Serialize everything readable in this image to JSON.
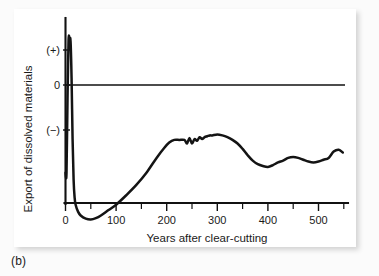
{
  "figure": {
    "panel_label": "(b)",
    "background_color": "#fbfbfb",
    "card_color": "#ffffff",
    "line_color": "#141414"
  },
  "chart_data": {
    "type": "line",
    "title": "",
    "subtitle": "",
    "xlabel": "Years after clear-cutting",
    "ylabel": "Export of dissolved materials",
    "xlim": [
      -8,
      560
    ],
    "ylim": [
      -3.1,
      1.35
    ],
    "grid": false,
    "legend": null,
    "legend_position": "none",
    "x_ticks": [
      0,
      100,
      200,
      300,
      400,
      500
    ],
    "x_tick_labels": [
      "0",
      "100",
      "200",
      "300",
      "400",
      "500"
    ],
    "x_minor_ticks": [
      50,
      150,
      250,
      350,
      450,
      550
    ],
    "y_ticks": [
      1,
      0,
      -1
    ],
    "y_tick_labels": [
      "(+)",
      "0",
      "(−)"
    ],
    "zero_reference_line": 0,
    "annotations": [],
    "series": [
      {
        "name": "Export of dissolved materials after clear-cutting",
        "x": [
          0,
          2,
          4,
          6,
          8,
          10,
          12,
          14,
          16,
          18,
          20,
          25,
          30,
          40,
          50,
          60,
          70,
          85,
          100,
          120,
          140,
          160,
          180,
          195,
          205,
          215,
          225,
          235,
          240,
          245,
          250,
          255,
          260,
          265,
          270,
          275,
          280,
          285,
          290,
          300,
          310,
          320,
          330,
          340,
          350,
          360,
          370,
          380,
          390,
          400,
          410,
          420,
          430,
          440,
          450,
          460,
          470,
          480,
          490,
          500,
          510,
          520,
          530,
          540,
          548
        ],
        "y": [
          -1.95,
          -1.95,
          -0.3,
          1.28,
          1.3,
          1.25,
          0.2,
          -1.2,
          -2.1,
          -2.5,
          -2.66,
          -2.82,
          -2.9,
          -2.97,
          -2.99,
          -2.96,
          -2.9,
          -2.78,
          -2.66,
          -2.45,
          -2.22,
          -1.95,
          -1.62,
          -1.4,
          -1.28,
          -1.22,
          -1.22,
          -1.22,
          -1.3,
          -1.18,
          -1.3,
          -1.2,
          -1.24,
          -1.16,
          -1.2,
          -1.16,
          -1.14,
          -1.12,
          -1.12,
          -1.1,
          -1.12,
          -1.16,
          -1.22,
          -1.3,
          -1.42,
          -1.56,
          -1.68,
          -1.76,
          -1.8,
          -1.82,
          -1.78,
          -1.72,
          -1.68,
          -1.62,
          -1.6,
          -1.62,
          -1.66,
          -1.7,
          -1.72,
          -1.7,
          -1.66,
          -1.62,
          -1.48,
          -1.44,
          -1.5
        ]
      }
    ]
  }
}
